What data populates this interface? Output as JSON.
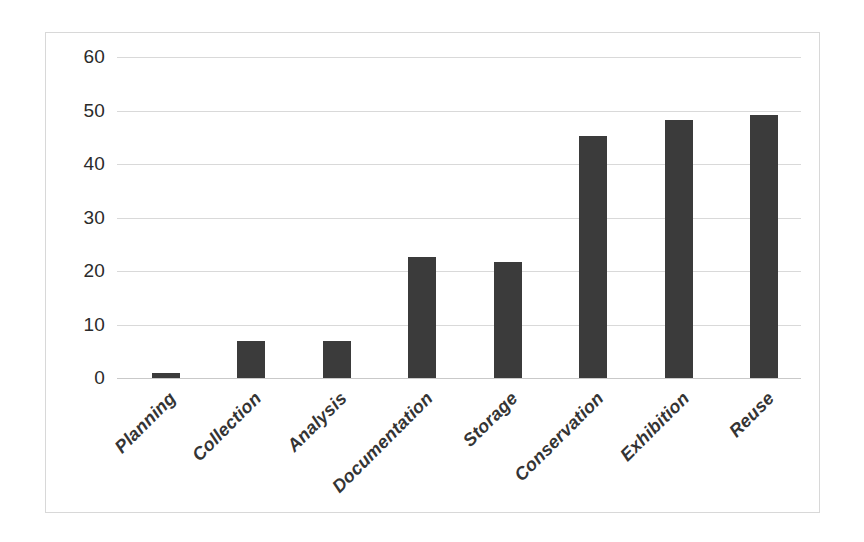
{
  "chart_data": {
    "type": "bar",
    "title": "",
    "subtitle": "",
    "xlabel": "",
    "ylabel": "",
    "ylim": [
      0,
      60
    ],
    "yticks": [
      0,
      10,
      20,
      30,
      40,
      50,
      60
    ],
    "grid": true,
    "legend": false,
    "legend_position": "none",
    "bar_color": "#3b3b3b",
    "gridline_color": "#d9d9d9",
    "border_color": "#d8d8d8",
    "categories": [
      "Planning",
      "Collection",
      "Analysis",
      "Documentation",
      "Storage",
      "Conservation",
      "Exhibition",
      "Reuse"
    ],
    "values": [
      1,
      7,
      7,
      22.7,
      21.6,
      45.2,
      48.3,
      49.2
    ]
  }
}
